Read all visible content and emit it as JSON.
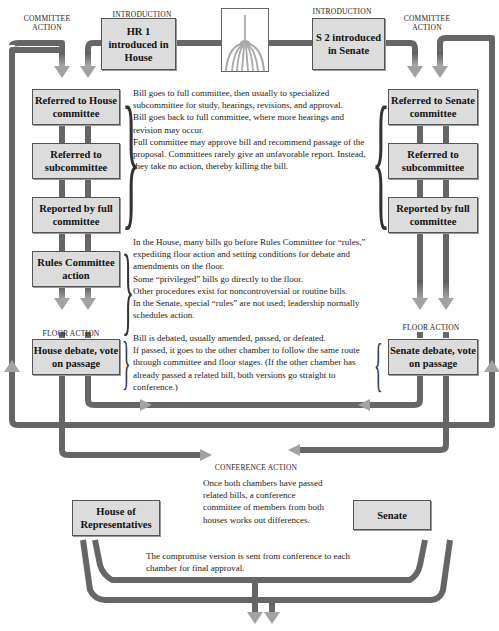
{
  "colors": {
    "wire": "#6b6b6b",
    "wire_dark": "#555555",
    "box_fill": "#dcdcdc",
    "arrow_head": "#a0a0a0"
  },
  "captions": {
    "committee_action_left": "COMMITTEE ACTION",
    "introduction_left": "INTRODUCTION",
    "introduction_right": "INTRODUCTION",
    "committee_action_right": "COMMITTEE ACTION",
    "floor_action_left": "FLOOR ACTION",
    "floor_action_right": "FLOOR ACTION",
    "conference_action": "CONFERENCE ACTION"
  },
  "icons": {
    "capitol": "capitol-dome-icon"
  },
  "house": {
    "intro": "HR 1 introduced in House",
    "referred_committee": "Referred to House committee",
    "referred_subcommittee": "Referred to subcommittee",
    "reported": "Reported by full committee",
    "rules": "Rules Committee action",
    "debate": "House debate, vote on passage"
  },
  "senate": {
    "intro": "S 2 introduced in Senate",
    "referred_committee": "Referred to Senate committee",
    "referred_subcommittee": "Referred to subcommittee",
    "reported": "Reported by full committee",
    "debate": "Senate debate, vote on passage"
  },
  "final": {
    "house": "House of Representatives",
    "senate": "Senate"
  },
  "notes": {
    "committee": [
      "Bill goes to full committee, then usually to specialized subcommittee for study, hearings, revisions, and approval.",
      "Bill goes back to full committee, where more hearings and revision may occur.",
      "Full committee may approve bill and recommend passage of the proposal. Committees rarely give an unfavorable report. Instead, they take no action, thereby killing the bill."
    ],
    "rules": [
      "In the House, many bills go before Rules Committee for “rules,” expediting floor action and setting conditions for debate and amendments on the floor.",
      "Some “privileged” bills go directly to the floor.",
      "Other procedures exist for noncontroversial or routine bills.",
      "In the Senate, special “rules” are not used; leadership normally schedules action."
    ],
    "floor": [
      "Bill is debated, usually amended, passed, or defeated.",
      "If passed, it goes to the other chamber to follow the same route through committee and floor stages. (If the other chamber has already passed a related bill, both versions go straight to conference.)"
    ],
    "conference": "Once both chambers have passed related bills, a conference committee of members from both houses works out differences.",
    "compromise": "The compromise version is sent from conference to each chamber for final approval."
  }
}
